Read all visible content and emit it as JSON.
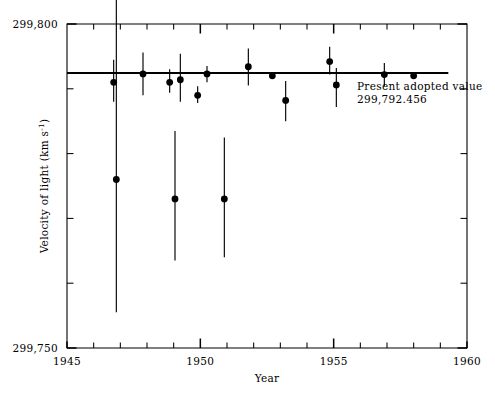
{
  "chart_data": {
    "type": "scatter",
    "title": "",
    "xlabel": "Year",
    "ylabel": "Velocity of light (km s",
    "ylabel_superscript": "-1",
    "ylabel_suffix": ")",
    "xlim": [
      1945,
      1960
    ],
    "ylim": [
      299750,
      299800
    ],
    "grid": false,
    "legend": null,
    "x_ticks_major": [
      1945,
      1950,
      1955,
      1960
    ],
    "x_tick_labels": [
      "1945",
      "1950",
      "1955",
      "1960"
    ],
    "x_ticks_minor": [
      1946,
      1947,
      1948,
      1949,
      1951,
      1952,
      1953,
      1954,
      1956,
      1957,
      1958,
      1959
    ],
    "y_ticks_major": [
      299750,
      299800
    ],
    "y_tick_labels": [
      "299,750",
      "299,800"
    ],
    "y_ticks_minor": [
      299760,
      299770,
      299780,
      299790
    ],
    "reference_line": {
      "label_line1": "Present adopted value",
      "label_line2": "299,792.456",
      "value": 299792.456,
      "x_start": 1945.0,
      "x_end": 1959.3
    },
    "series": [
      {
        "name": "Measured velocity of light",
        "marker": "filled-circle",
        "points": [
          {
            "x": 1946.75,
            "y": 299791.0,
            "yerr_low": 299788.0,
            "yerr_high": 299794.5
          },
          {
            "x": 1946.85,
            "y": 299776.0,
            "yerr_low": 299755.5,
            "yerr_high": 299805.5
          },
          {
            "x": 1947.85,
            "y": 299792.3,
            "yerr_low": 299789.0,
            "yerr_high": 299795.6
          },
          {
            "x": 1948.85,
            "y": 299791.0,
            "yerr_low": 299789.4,
            "yerr_high": 299793.0
          },
          {
            "x": 1949.25,
            "y": 299791.4,
            "yerr_low": 299788.0,
            "yerr_high": 299795.4
          },
          {
            "x": 1949.05,
            "y": 299773.0,
            "yerr_low": 299763.5,
            "yerr_high": 299783.5
          },
          {
            "x": 1949.9,
            "y": 299789.0,
            "yerr_low": 299787.8,
            "yerr_high": 299790.4
          },
          {
            "x": 1950.25,
            "y": 299792.3,
            "yerr_low": 299791.0,
            "yerr_high": 299793.5
          },
          {
            "x": 1950.9,
            "y": 299773.0,
            "yerr_low": 299764.0,
            "yerr_high": 299782.5
          },
          {
            "x": 1951.8,
            "y": 299793.4,
            "yerr_low": 299790.5,
            "yerr_high": 299796.2
          },
          {
            "x": 1952.7,
            "y": 299792.0,
            "yerr_low": 299792.0,
            "yerr_high": 299792.0
          },
          {
            "x": 1953.2,
            "y": 299788.2,
            "yerr_low": 299785.0,
            "yerr_high": 299791.2
          },
          {
            "x": 1954.85,
            "y": 299794.2,
            "yerr_low": 299792.2,
            "yerr_high": 299796.5
          },
          {
            "x": 1955.1,
            "y": 299790.6,
            "yerr_low": 299787.2,
            "yerr_high": 299793.2
          },
          {
            "x": 1956.9,
            "y": 299792.2,
            "yerr_low": 299790.4,
            "yerr_high": 299794.0
          },
          {
            "x": 1958.0,
            "y": 299792.0,
            "yerr_low": 299792.0,
            "yerr_high": 299792.0
          }
        ]
      }
    ]
  }
}
